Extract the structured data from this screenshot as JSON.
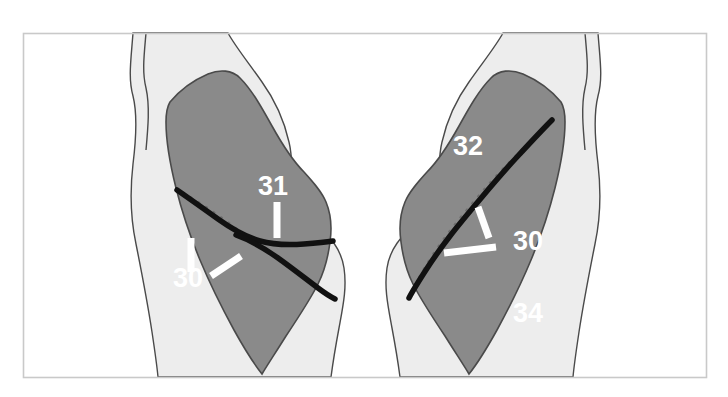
{
  "figure": {
    "background_color": "#ffffff",
    "frame_color": "#c9c9c9",
    "body_fill": "#ededed",
    "lung_fill": "#8a8a8a",
    "outline_color": "#4a4a4a",
    "fissure_color": "#111111",
    "label_color": "#ffffff",
    "dotted_line_color": "#6d6d6d"
  },
  "panels": [
    {
      "id": "left-panel",
      "name": "right-lung-lateral-view",
      "labels": [
        {
          "id": "left-31",
          "text": "31",
          "x": 258,
          "y": 195
        },
        {
          "id": "left-30",
          "text": "30",
          "x": 173,
          "y": 287
        }
      ]
    },
    {
      "id": "right-panel",
      "name": "left-lung-lateral-view",
      "labels": [
        {
          "id": "right-32",
          "text": "32",
          "x": 453,
          "y": 155
        },
        {
          "id": "right-30",
          "text": "30",
          "x": 513,
          "y": 240
        },
        {
          "id": "right-34",
          "text": "34",
          "x": 513,
          "y": 322
        }
      ]
    }
  ],
  "callout_numbers": [
    "30",
    "31",
    "32",
    "34"
  ]
}
